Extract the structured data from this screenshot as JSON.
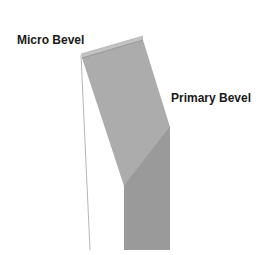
{
  "diagram": {
    "labels": {
      "micro_bevel": "Micro Bevel",
      "primary_bevel": "Primary Bevel"
    },
    "colors": {
      "background": "#ffffff",
      "micro_bevel_face": "#c2c2c2",
      "micro_bevel_edge": "#8a8a8a",
      "primary_bevel_face": "#acacac",
      "blade_face": "#9a9a9a",
      "back_edge_line": "#b5b5b5",
      "label_text": "#1a1a1a"
    },
    "shapes": {
      "micro_bevel": "81,54 143,36 143,40 82,58",
      "primary_bevel": "82,58 143,40 170,127 124,186",
      "blade_body": "124,186 170,127 170,250 124,250",
      "back_edge": "81,55 90,250"
    }
  }
}
